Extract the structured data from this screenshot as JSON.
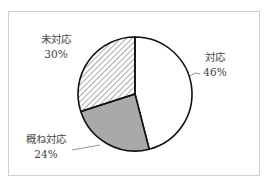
{
  "chart_data": {
    "type": "pie",
    "title": "",
    "slices": [
      {
        "label": "対応",
        "value": 46,
        "pct_label": "46%",
        "fill": "#ffffff",
        "pattern": "solid"
      },
      {
        "label": "概ね対応",
        "value": 24,
        "pct_label": "24%",
        "fill": "#a9a9a9",
        "pattern": "solid"
      },
      {
        "label": "未対応",
        "value": 30,
        "pct_label": "30%",
        "fill": "#ffffff",
        "pattern": "diagonal-hatch"
      }
    ],
    "start_angle": "12 o'clock",
    "direction": "clockwise",
    "legend": "none (direct labels)"
  },
  "labels": {
    "taiou": {
      "name": "対応",
      "pct": "46%"
    },
    "gaone": {
      "name": "概ね対応",
      "pct": "24%"
    },
    "mitaiou": {
      "name": "未対応",
      "pct": "30%"
    }
  }
}
